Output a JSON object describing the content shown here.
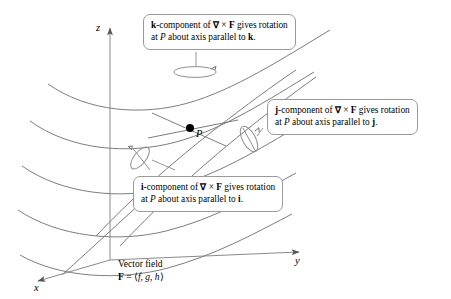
{
  "figure": {
    "background": "#ffffff",
    "line_color": "#7d7d7d",
    "axis_color": "#8a8a8a",
    "text_color": "#000000",
    "callout_border": "#9a9a9a"
  },
  "axes": {
    "x_label": "x",
    "y_label": "y",
    "z_label": "z"
  },
  "point": {
    "label": "P"
  },
  "callouts": {
    "k": {
      "line1_a": "k",
      "line1_b": "-component of ",
      "line1_c": "∇",
      "line1_d": " × ",
      "line1_e": "F",
      "line1_f": " gives rotation",
      "line2_a": "at ",
      "line2_b": "P",
      "line2_c": " about axis parallel to ",
      "line2_d": "k",
      "line2_e": "."
    },
    "j": {
      "line1_a": "j",
      "line1_b": "-component of ",
      "line1_c": "∇",
      "line1_d": " × ",
      "line1_e": "F",
      "line1_f": " gives rotation",
      "line2_a": "at ",
      "line2_b": "P",
      "line2_c": " about axis parallel to ",
      "line2_d": "j",
      "line2_e": "."
    },
    "i": {
      "line1_a": "i",
      "line1_b": "-component of ",
      "line1_c": "∇",
      "line1_d": " × ",
      "line1_e": "F",
      "line1_f": " gives rotation",
      "line2_a": "at ",
      "line2_b": "P",
      "line2_c": " about axis parallel to ",
      "line2_d": "i",
      "line2_e": "."
    }
  },
  "vector_field": {
    "line1": "Vector field",
    "line2_a": "F",
    "line2_b": " = ⟨",
    "line2_c": "f",
    "line2_d": ", ",
    "line2_e": "g",
    "line2_f": ", ",
    "line2_g": "h",
    "line2_h": "⟩"
  }
}
